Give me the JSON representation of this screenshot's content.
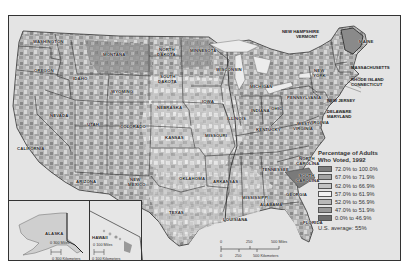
{
  "legend": {
    "title_line1": "Percentage of Adults",
    "title_line2": "Who Voted, 1992",
    "classes": [
      {
        "label": "72.0% to 100.0%",
        "color": "#7d7d7d"
      },
      {
        "label": "67.0% to 71.9%",
        "color": "#a3a3a3"
      },
      {
        "label": "62.0% to 66.9%",
        "color": "#c4c4c4"
      },
      {
        "label": "57.0% to 61.9%",
        "color": "#f2f2f2"
      },
      {
        "label": "52.0% to 56.9%",
        "color": "#b8b8b8"
      },
      {
        "label": "47.0% to 51.9%",
        "color": "#999999"
      },
      {
        "label": "0.0% to 46.9%",
        "color": "#6e6e6e"
      }
    ],
    "us_average": "U.S. average:  55%"
  },
  "states": [
    {
      "name": "WASHINGTON",
      "x": 24,
      "y": 24
    },
    {
      "name": "OREGON",
      "x": 25,
      "y": 53
    },
    {
      "name": "IDAHO",
      "x": 64,
      "y": 61
    },
    {
      "name": "MONTANA",
      "x": 94,
      "y": 37
    },
    {
      "name": "WYOMING",
      "x": 102,
      "y": 74
    },
    {
      "name": "NORTH",
      "x": 150,
      "y": 32
    },
    {
      "name": "DAKOTA",
      "x": 148,
      "y": 37
    },
    {
      "name": "MINNESOTA",
      "x": 181,
      "y": 33
    },
    {
      "name": "SOUTH",
      "x": 151,
      "y": 59
    },
    {
      "name": "DAKOTA",
      "x": 149,
      "y": 64
    },
    {
      "name": "WISCONSIN",
      "x": 207,
      "y": 52
    },
    {
      "name": "MICHIGAN",
      "x": 241,
      "y": 69
    },
    {
      "name": "NEW",
      "x": 305,
      "y": 53
    },
    {
      "name": "YORK",
      "x": 304,
      "y": 58
    },
    {
      "name": "MAINE",
      "x": 350,
      "y": 24
    },
    {
      "name": "NEVADA",
      "x": 41,
      "y": 98
    },
    {
      "name": "UTAH",
      "x": 78,
      "y": 107
    },
    {
      "name": "COLORADO",
      "x": 111,
      "y": 109
    },
    {
      "name": "NEBRASKA",
      "x": 148,
      "y": 90
    },
    {
      "name": "IOWA",
      "x": 193,
      "y": 84
    },
    {
      "name": "ILLINOIS",
      "x": 218,
      "y": 101
    },
    {
      "name": "INDIANA",
      "x": 242,
      "y": 93
    },
    {
      "name": "OHIO",
      "x": 262,
      "y": 91
    },
    {
      "name": "PENNSYLVANIA",
      "x": 278,
      "y": 80
    },
    {
      "name": "KANSAS",
      "x": 156,
      "y": 120
    },
    {
      "name": "MISSOURI",
      "x": 196,
      "y": 118
    },
    {
      "name": "KENTUCKY",
      "x": 247,
      "y": 112
    },
    {
      "name": "WEST",
      "x": 288,
      "y": 106
    },
    {
      "name": "VIRGINIA",
      "x": 284,
      "y": 111
    },
    {
      "name": "VIRGINIA",
      "x": 300,
      "y": 105
    },
    {
      "name": "CALIFORNIA",
      "x": 8,
      "y": 131
    },
    {
      "name": "ARIZONA",
      "x": 67,
      "y": 164
    },
    {
      "name": "NEW",
      "x": 121,
      "y": 162
    },
    {
      "name": "MEXICO",
      "x": 119,
      "y": 167
    },
    {
      "name": "OKLAHOMA",
      "x": 170,
      "y": 161
    },
    {
      "name": "ARKANSAS",
      "x": 204,
      "y": 164
    },
    {
      "name": "TENNESSEE",
      "x": 253,
      "y": 152
    },
    {
      "name": "NORTH",
      "x": 290,
      "y": 141
    },
    {
      "name": "CAROLINA",
      "x": 287,
      "y": 146
    },
    {
      "name": "SOUTH",
      "x": 290,
      "y": 158
    },
    {
      "name": "CAROLINA",
      "x": 287,
      "y": 163
    },
    {
      "name": "TEXAS",
      "x": 160,
      "y": 195
    },
    {
      "name": "MISSISSIPPI",
      "x": 233,
      "y": 180
    },
    {
      "name": "ALABAMA",
      "x": 251,
      "y": 187
    },
    {
      "name": "GEORGIA",
      "x": 277,
      "y": 177
    },
    {
      "name": "LOUISIANA",
      "x": 214,
      "y": 202
    },
    {
      "name": "FLORIDA",
      "x": 294,
      "y": 205
    }
  ],
  "external_labels": {
    "new_hampshire": "NEW HAMPSHIRE",
    "vermont": "VERMONT",
    "massachusetts": "MASSACHUSETTS",
    "rhode_island": "RHODE ISLAND",
    "connecticut": "CONNECTICUT",
    "new_jersey": "NEW JERSEY",
    "delaware": "DELAWARE",
    "maryland": "MARYLAND"
  },
  "scale_bar": {
    "miles_ticks": [
      "0",
      "250",
      "500 Miles"
    ],
    "km_ticks": [
      "0",
      "250",
      "500 Kilometers"
    ]
  },
  "insets": {
    "alaska": {
      "label": "ALASKA",
      "miles": "0     300 Miles",
      "km": "0 300 Kilometers"
    },
    "hawaii": {
      "label": "HAWAII",
      "miles": "0   100 Miles",
      "km": "0   100 Kilometers"
    }
  }
}
